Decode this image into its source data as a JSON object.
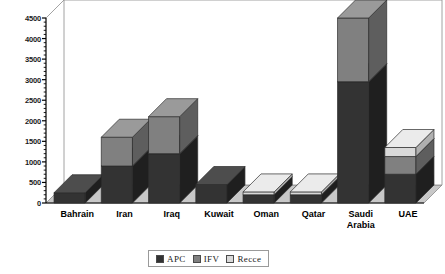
{
  "chart_data": {
    "type": "bar",
    "subtype": "stacked-column-3d",
    "title": "",
    "xlabel": "",
    "ylabel": "",
    "ylim": [
      0,
      4500
    ],
    "ytick_step": 500,
    "minor_ticks": true,
    "grid": false,
    "legend_position": "bottom-center",
    "categories": [
      "Bahrain",
      "Iran",
      "Iraq",
      "Kuwait",
      "Oman",
      "Qatar",
      "Saudi Arabia",
      "UAE"
    ],
    "ytick_labels": [
      "0",
      "500",
      "1000",
      "1500",
      "2000",
      "2500",
      "3000",
      "3500",
      "4000",
      "4500"
    ],
    "ytick_values": [
      0,
      500,
      1000,
      1500,
      2000,
      2500,
      3000,
      3500,
      4000,
      4500
    ],
    "series": [
      {
        "name": "APC",
        "color": "#333333",
        "values": [
          250,
          900,
          1200,
          450,
          200,
          200,
          2950,
          700
        ]
      },
      {
        "name": "IFV",
        "color": "#808080",
        "values": [
          0,
          700,
          900,
          0,
          0,
          0,
          1550,
          430
        ]
      },
      {
        "name": "Recce",
        "color": "#d9d9d9",
        "values": [
          0,
          0,
          0,
          0,
          70,
          70,
          0,
          220
        ]
      }
    ],
    "totals": [
      250,
      1600,
      2100,
      450,
      270,
      270,
      4500,
      1350
    ]
  },
  "legend": {
    "items": [
      {
        "label": "APC",
        "swatch": "legend-swatch-apc"
      },
      {
        "label": "IFV",
        "swatch": "legend-swatch-ifv"
      },
      {
        "label": "Recce",
        "swatch": "legend-swatch-recce"
      }
    ]
  },
  "colors": {
    "apc": "#333333",
    "apc_side": "#1f1f1f",
    "apc_top": "#4d4d4d",
    "ifv": "#808080",
    "ifv_side": "#5e5e5e",
    "ifv_top": "#9a9a9a",
    "recce": "#d9d9d9",
    "recce_side": "#b0b0b0",
    "recce_top": "#ebebeb",
    "floor": "#c8c8c8",
    "wall": "#ffffff",
    "frame": "#8c8c8c",
    "axis": "#000000"
  }
}
